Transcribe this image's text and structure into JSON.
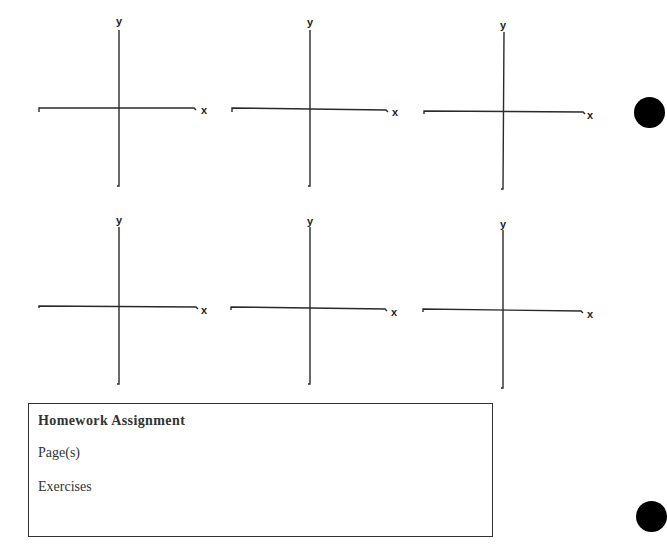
{
  "graphs": [
    {
      "id": 1,
      "x_label": "x",
      "y_label": "y"
    },
    {
      "id": 2,
      "x_label": "x",
      "y_label": "y"
    },
    {
      "id": 3,
      "x_label": "x",
      "y_label": "y"
    },
    {
      "id": 4,
      "x_label": "x",
      "y_label": "y"
    },
    {
      "id": 5,
      "x_label": "x",
      "y_label": "y"
    },
    {
      "id": 6,
      "x_label": "x",
      "y_label": "y"
    }
  ],
  "homework": {
    "title": "Homework Assignment",
    "pages_label": "Page(s)",
    "exercises_label": "Exercises"
  },
  "colors": {
    "ink": "#222222",
    "hole": "#000000"
  }
}
